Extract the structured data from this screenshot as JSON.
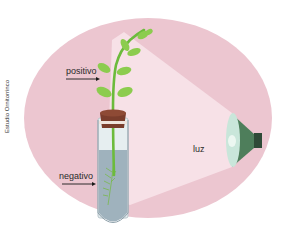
{
  "figure": {
    "credit": "Estudio Ornitorrinco",
    "labels": {
      "positive": "positivo",
      "negative": "negativo",
      "light": "luz"
    },
    "icons": {
      "plant": "seedling",
      "test_tube": "test-tube-with-water",
      "lamp": "lamp",
      "arrow_positive": "arrow-right",
      "arrow_negative": "arrow-right"
    },
    "colors": {
      "background_ellipse": "#ecc6d0",
      "light_cone": "#f7e1e7",
      "leaf": "#8ccc4e",
      "stem": "#6cbb3c",
      "cork": "#7a3d2c",
      "water": "#9fb2bd",
      "lamp_body": "#4e7e5b",
      "lamp_lens": "#c9e6da",
      "lamp_base": "#2f4a37"
    }
  }
}
